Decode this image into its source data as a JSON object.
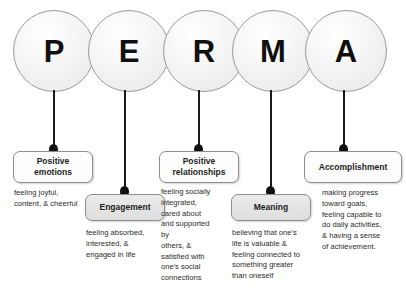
{
  "diagram": {
    "background_color": "#ffffff",
    "line_color": "#1a1a1a",
    "box_border_color": "#8d8d8d"
  },
  "circles": [
    {
      "letter": "P",
      "name": "circle-p"
    },
    {
      "letter": "E",
      "name": "circle-e"
    },
    {
      "letter": "R",
      "name": "circle-r"
    },
    {
      "letter": "M",
      "name": "circle-m"
    },
    {
      "letter": "A",
      "name": "circle-a"
    }
  ],
  "elements": [
    {
      "key": "positive-emotions",
      "label": "Positive\nemotions",
      "description": "feeling joyful,\ncontent, & cheerful",
      "fill": "white"
    },
    {
      "key": "engagement",
      "label": "Engagement",
      "description": "feeling absorbed,\ninterested, &\nengaged in life",
      "fill": "gray"
    },
    {
      "key": "positive-relationships",
      "label": "Positive\nrelationships",
      "description": "feeling socially\nintegrated,\ncared about\nand supported\nby\nothers, &\nsatisfied with\none's social\nconnections",
      "fill": "white"
    },
    {
      "key": "meaning",
      "label": "Meaning",
      "description": "believing that one's\nlife is valuable &\nfeeling connected to\nsomething greater\nthan oneself",
      "fill": "gray"
    },
    {
      "key": "accomplishment",
      "label": "Accomplishment",
      "description": "making progress\ntoward goals,\nfeeling capable to\ndo daily activities,\n& having a sense\nof achievement.",
      "fill": "white"
    }
  ]
}
